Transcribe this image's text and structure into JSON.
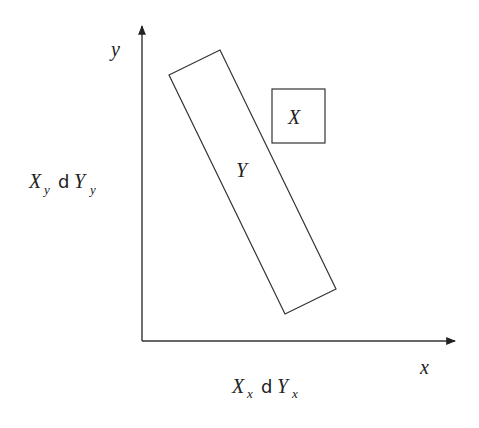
{
  "diagram": {
    "type": "coordinate-sketch",
    "colors": {
      "background": "#ffffff",
      "lines": "#333333",
      "text": "#222222"
    },
    "axes": {
      "x_label": "x",
      "y_label": "y"
    },
    "shapes": {
      "set_x": {
        "label": "X",
        "shape": "square"
      },
      "set_y": {
        "label": "Y",
        "shape": "rotated-rectangle"
      }
    },
    "annotations": {
      "vertical": {
        "base1": "X",
        "sub1": "y",
        "op": "d",
        "base2": "Y",
        "sub2": "y"
      },
      "horizontal": {
        "base1": "X",
        "sub1": "x",
        "op": "d",
        "base2": "Y",
        "sub2": "x"
      }
    }
  }
}
